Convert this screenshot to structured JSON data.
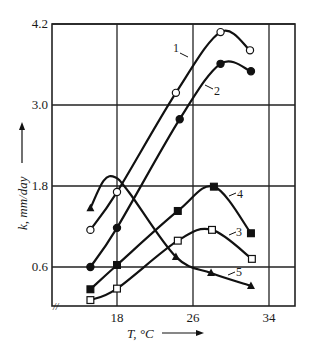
{
  "chart_data": {
    "type": "line",
    "title": "",
    "xlabel": "T, °C",
    "ylabel": "k, mm/day",
    "x_ticks": [
      18,
      26,
      34
    ],
    "y_ticks": [
      0.6,
      1.8,
      3.0,
      4.2
    ],
    "x_tick_labels": [
      "18",
      "26",
      "34"
    ],
    "y_tick_labels": [
      "0.6",
      "1.8",
      "3.0",
      "4.2"
    ],
    "xlim": [
      11.2,
      36.5
    ],
    "ylim": [
      0.0,
      4.2
    ],
    "grid": true,
    "axis_break_symbol": "//",
    "legend": "inline numeric labels 1–5",
    "series": [
      {
        "name": "1",
        "marker": "open-circle",
        "x": [
          15.2,
          18.0,
          24.2,
          28.9,
          32.0
        ],
        "values": [
          1.15,
          1.71,
          3.18,
          4.08,
          3.81
        ]
      },
      {
        "name": "2",
        "marker": "filled-circle",
        "x": [
          15.2,
          18.0,
          24.6,
          28.9,
          32.1
        ],
        "values": [
          0.6,
          1.18,
          2.79,
          3.61,
          3.5
        ]
      },
      {
        "name": "3",
        "marker": "open-square",
        "x": [
          15.2,
          18.0,
          24.4,
          28.0,
          32.2
        ],
        "values": [
          0.11,
          0.28,
          0.99,
          1.15,
          0.72
        ]
      },
      {
        "name": "4",
        "marker": "filled-square",
        "x": [
          15.2,
          18.0,
          24.4,
          28.2,
          32.1
        ],
        "values": [
          0.27,
          0.63,
          1.43,
          1.79,
          1.1
        ]
      },
      {
        "name": "5",
        "marker": "filled-triangle",
        "x": [
          15.2,
          24.2,
          27.9,
          32.1
        ],
        "values": [
          1.47,
          0.75,
          0.51,
          0.32
        ]
      }
    ]
  }
}
